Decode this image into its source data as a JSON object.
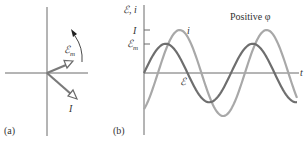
{
  "panel_a": {
    "label": "(a)",
    "phasors": [
      {
        "name": "emf-amplitude",
        "label": "ℰ",
        "subscript": "m",
        "angle_deg": 24,
        "length": 27
      },
      {
        "name": "current-amplitude",
        "label": "I",
        "angle_deg": -43,
        "length": 41
      }
    ],
    "rotation": "counterclockwise",
    "colors": {
      "axis": "#555555",
      "phasor": "#7a7a7a",
      "arrowhead_fill": "#ffffff"
    }
  },
  "panel_b": {
    "label": "(b)",
    "y_axis_label": "ℰ, i",
    "y_tick_I": "I",
    "y_tick_Em": "ℰ",
    "y_tick_Em_sub": "m",
    "x_axis_label": "t",
    "annotation": "Positive φ",
    "curve_label_i": "i",
    "curve_label_emf": "ℰ",
    "colors": {
      "emf": "#6e6e6e",
      "current": "#a8a8a8",
      "axis": "#666666"
    }
  },
  "chart_data": {
    "type": "line",
    "title": "Positive φ",
    "xlabel": "t",
    "ylabel": "ℰ, i",
    "grid": false,
    "x_range_periods": [
      0,
      1.75
    ],
    "series": [
      {
        "name": "ℰ (emf)",
        "amplitude_label": "ℰm",
        "amplitude": 0.68,
        "phase_lag_periods": 0.0
      },
      {
        "name": "i (current)",
        "amplitude_label": "I",
        "amplitude": 1.0,
        "phase_lag_periods": 0.16
      }
    ],
    "y_ticks": [
      "I",
      "ℰm"
    ]
  }
}
